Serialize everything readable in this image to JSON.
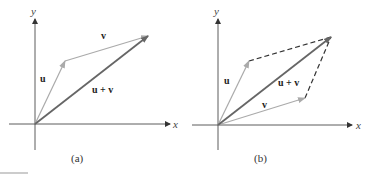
{
  "figure": {
    "panels": [
      {
        "id": "a",
        "caption": "(a)",
        "axis_labels": {
          "x": "x",
          "y": "y"
        },
        "vectors": [
          {
            "label": "u",
            "from": "origin",
            "to": "tip of u"
          },
          {
            "label": "v",
            "from": "tip of u",
            "to": "tip of u + v"
          },
          {
            "label": "u + v",
            "from": "origin",
            "to": "tip of u + v"
          }
        ]
      },
      {
        "id": "b",
        "caption": "(b)",
        "axis_labels": {
          "x": "x",
          "y": "y"
        },
        "vectors": [
          {
            "label": "u",
            "from": "origin",
            "to": "tip of u"
          },
          {
            "label": "v",
            "from": "origin",
            "to": "tip of v"
          },
          {
            "label": "u + v",
            "from": "origin",
            "to": "tip of u + v"
          }
        ],
        "dashed_sides": "parallelogram completion"
      }
    ],
    "colors": {
      "resultant": "#555555",
      "component": "#999999",
      "axis": "#333333"
    }
  }
}
